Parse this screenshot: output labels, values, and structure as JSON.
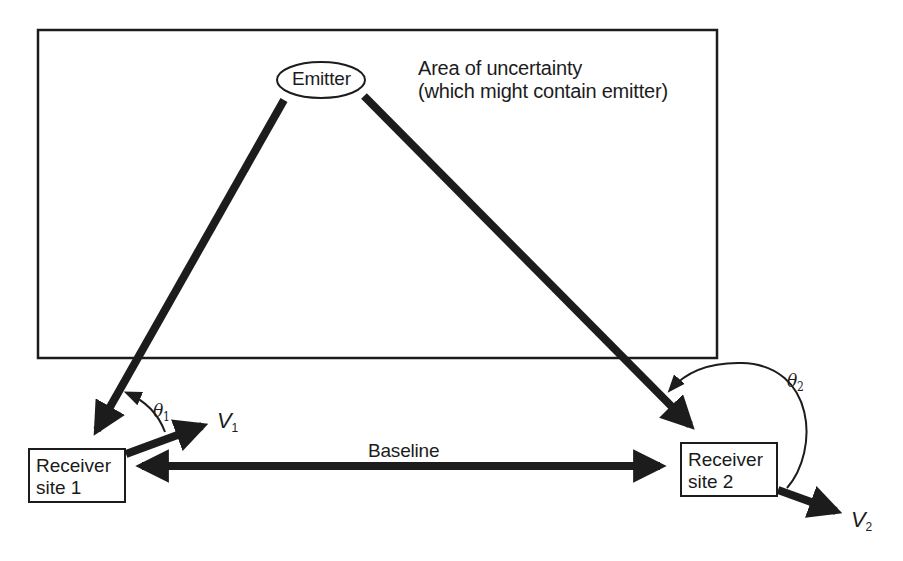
{
  "diagram": {
    "type": "emitter geolocation geometry",
    "area": {
      "label_line1": "Area of uncertainty",
      "label_line2": "(which might contain emitter)"
    },
    "emitter": {
      "label": "Emitter"
    },
    "receivers": [
      {
        "line1": "Receiver",
        "line2": "site 1"
      },
      {
        "line1": "Receiver",
        "line2": "site 2"
      }
    ],
    "baseline": {
      "label": "Baseline"
    },
    "angles": [
      {
        "symbol": "θ",
        "subscript": "1"
      },
      {
        "symbol": "θ",
        "subscript": "2"
      }
    ],
    "velocities": [
      {
        "symbol": "V",
        "subscript": "1"
      },
      {
        "symbol": "V",
        "subscript": "2"
      }
    ],
    "colors": {
      "ink": "#1c1c1c",
      "background": "#ffffff"
    }
  }
}
